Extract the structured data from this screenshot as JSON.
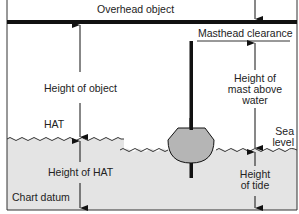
{
  "diagram": {
    "labels": {
      "overhead_object": "Overhead object",
      "masthead_clearance": "Masthead clearance",
      "height_of_object": "Height of object",
      "height_of_mast_line1": "Height of",
      "height_of_mast_line2": "mast above",
      "height_of_mast_line3": "water",
      "hat": "HAT",
      "sea_level_line1": "Sea",
      "sea_level_line2": "level",
      "height_of_hat": "Height of HAT",
      "chart_datum": "Chart datum",
      "height_of_tide_line1": "Height",
      "height_of_tide_line2": "of tide"
    },
    "colors": {
      "line": "#111111",
      "water": "#e4e4e4",
      "hull": "#b5b5b5",
      "text": "#222222"
    }
  }
}
